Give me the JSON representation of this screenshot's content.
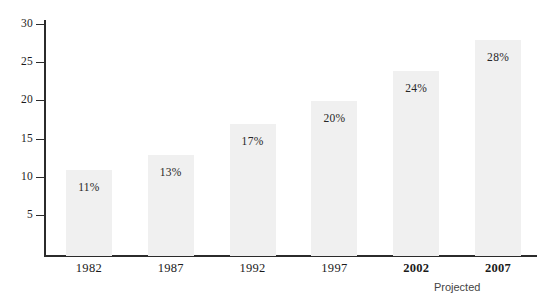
{
  "chart_data": {
    "type": "bar",
    "title": "",
    "subtitle": "",
    "xlabel": "",
    "ylabel": "",
    "categories": [
      "1982",
      "1987",
      "1992",
      "1997",
      "2002",
      "2007"
    ],
    "values": [
      11,
      13,
      17,
      20,
      24,
      28
    ],
    "data_labels": [
      "11%",
      "13%",
      "17%",
      "20%",
      "24%",
      "28%"
    ],
    "ylim": [
      0,
      30
    ],
    "yticks": [
      5,
      10,
      15,
      20,
      25,
      30
    ],
    "ytick_labels": [
      "5",
      "10",
      "15",
      "20",
      "25",
      "30"
    ],
    "grid": false,
    "legend": null,
    "bold_categories": [
      "2002",
      "2007"
    ],
    "annotations": [
      {
        "text": "Projected",
        "relates_to": [
          "2002",
          "2007"
        ],
        "position": "below-axis-right"
      }
    ],
    "colors": {
      "bar_fill": "#f0f0f0",
      "axis": "#2b2b2b",
      "text": "#1b1b1b",
      "annotation_text": "#444444",
      "background": "#ffffff"
    }
  }
}
